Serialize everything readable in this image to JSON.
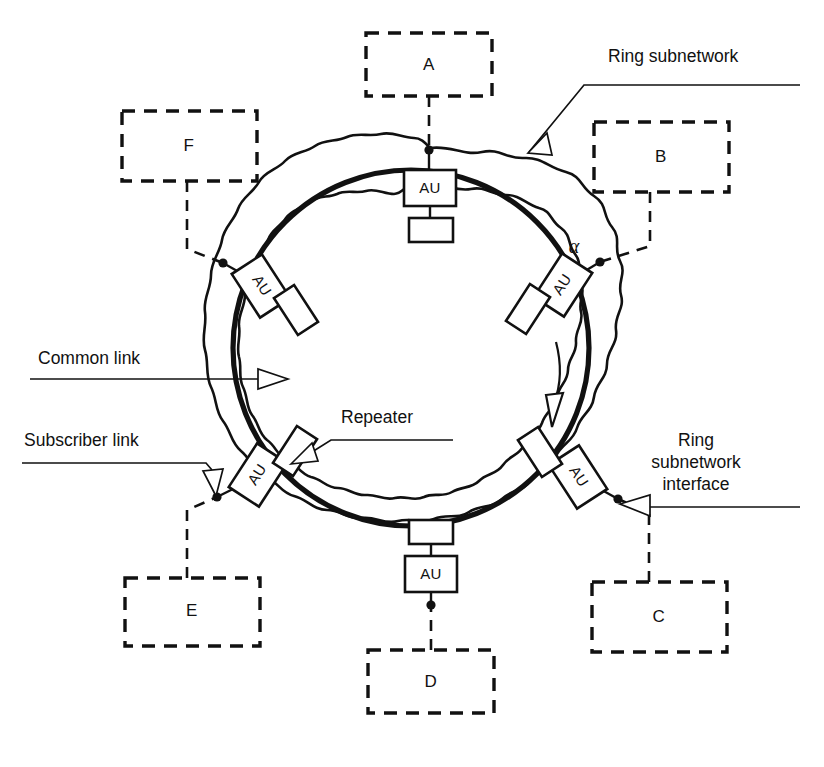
{
  "figure": {
    "background_color": "#ffffff",
    "line_color": "#111111"
  },
  "stations": [
    {
      "id": "A",
      "label": "A",
      "position": "top",
      "box": {
        "x": 366,
        "y": 33,
        "w": 126,
        "h": 63
      }
    },
    {
      "id": "B",
      "label": "B",
      "position": "upper-right",
      "box": {
        "x": 594,
        "y": 122,
        "w": 135,
        "h": 70
      }
    },
    {
      "id": "C",
      "label": "C",
      "position": "lower-right",
      "box": {
        "x": 592,
        "y": 582,
        "w": 135,
        "h": 70
      }
    },
    {
      "id": "D",
      "label": "D",
      "position": "bottom",
      "box": {
        "x": 368,
        "y": 650,
        "w": 126,
        "h": 63
      }
    },
    {
      "id": "E",
      "label": "E",
      "position": "lower-left",
      "box": {
        "x": 125,
        "y": 578,
        "w": 135,
        "h": 68
      }
    },
    {
      "id": "F",
      "label": "F",
      "position": "upper-left",
      "box": {
        "x": 122,
        "y": 111,
        "w": 135,
        "h": 70
      }
    }
  ],
  "access_units": [
    {
      "id": "au-a",
      "label": "AU",
      "attached_to": "A"
    },
    {
      "id": "au-b",
      "label": "AU",
      "attached_to": "B"
    },
    {
      "id": "au-c",
      "label": "AU",
      "attached_to": "C"
    },
    {
      "id": "au-d",
      "label": "AU",
      "attached_to": "D"
    },
    {
      "id": "au-e",
      "label": "AU",
      "attached_to": "E"
    },
    {
      "id": "au-f",
      "label": "AU",
      "attached_to": "F"
    }
  ],
  "repeaters": {
    "count": 6,
    "note": "small rectangles on the ring, one per access unit"
  },
  "annotations": {
    "ring_subnetwork": {
      "label": "Ring subnetwork",
      "x": 608,
      "y": 50
    },
    "common_link": {
      "label": "Common link",
      "x": 38,
      "y": 355
    },
    "subscriber_link": {
      "label": "Subscriber link",
      "x": 24,
      "y": 437
    },
    "repeater": {
      "label": "Repeater",
      "x": 341,
      "y": 413
    },
    "ring_interface": {
      "lines": [
        "Ring",
        "subnetwork",
        "interface"
      ],
      "x": 696,
      "y": 441
    },
    "alpha_marker": {
      "label": "α",
      "x": 574,
      "y": 248
    }
  },
  "ring_direction": {
    "label": "clockwise",
    "arrow": "curved-down-arrow-inside-ring"
  },
  "colors": {
    "ink": "#111111",
    "paper": "#ffffff"
  }
}
